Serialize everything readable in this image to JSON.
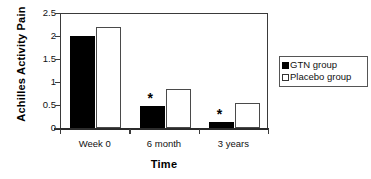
{
  "chart_data": {
    "type": "bar",
    "title": "",
    "xlabel": "Time",
    "ylabel": "Achilles Activity Pain",
    "categories": [
      "Week 0",
      "6 month",
      "3 years"
    ],
    "series": [
      {
        "name": "GTN group",
        "color": "#000000",
        "values": [
          2.0,
          0.47,
          0.13
        ]
      },
      {
        "name": "Placebo group",
        "color": "#ffffff",
        "values": [
          2.2,
          0.85,
          0.54
        ]
      }
    ],
    "ylim": [
      0,
      2.5
    ],
    "yticks": [
      "0",
      "0.5",
      "1",
      "1.5",
      "2",
      "2.5"
    ],
    "ytick_values": [
      0,
      0.5,
      1,
      1.5,
      2,
      2.5
    ],
    "grid": false,
    "legend_position": "right",
    "annotations": [
      {
        "text": "*",
        "category": "6 month",
        "series": "GTN group"
      },
      {
        "text": "*",
        "category": "3 years",
        "series": "GTN group"
      }
    ]
  },
  "legend": {
    "items": [
      {
        "label": "GTN group",
        "swatch": "filled-square"
      },
      {
        "label": "Placebo group",
        "swatch": "open-square"
      }
    ]
  },
  "axis": {
    "y_title": "Achilles Activity Pain",
    "x_title": "Time"
  }
}
